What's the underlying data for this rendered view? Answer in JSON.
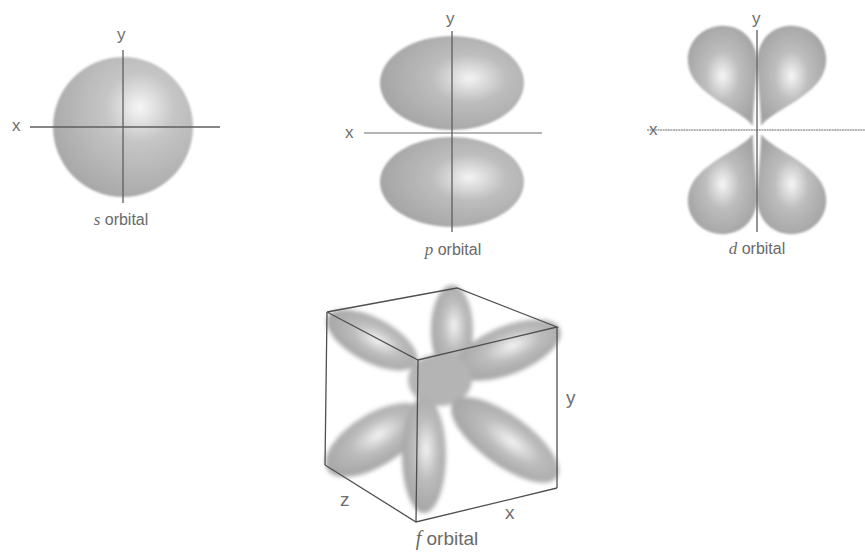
{
  "figure": {
    "colors": {
      "background": "#ffffff",
      "lobe_fill": "#a9a9a9",
      "lobe_highlight": "#f4f4f4",
      "axis_line": "#5e5e5e",
      "label_text": "#6f6f6f"
    },
    "panels": [
      {
        "id": "s",
        "letter": "s",
        "caption_rest": " orbital",
        "axes": {
          "x_label": "x",
          "y_label": "y"
        },
        "shape": "sphere"
      },
      {
        "id": "p",
        "letter": "p",
        "caption_rest": " orbital",
        "axes": {
          "x_label": "x",
          "y_label": "y"
        },
        "shape": "two lobes along y-axis"
      },
      {
        "id": "d",
        "letter": "d",
        "caption_rest": " orbital",
        "axes": {
          "x_label": "x",
          "y_label": "y"
        },
        "shape": "four lobes between axes"
      },
      {
        "id": "f",
        "letter": "f",
        "caption_rest": " orbital",
        "axes": {
          "x_label": "x",
          "y_label": "y",
          "z_label": "z"
        },
        "shape": "multi-lobed inside cube"
      }
    ]
  }
}
